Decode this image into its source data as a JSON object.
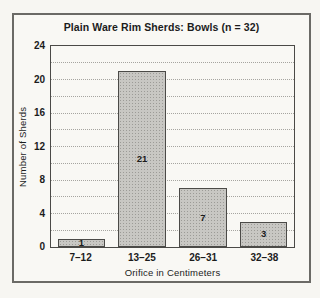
{
  "chart_data": {
    "type": "bar",
    "title": "Plain Ware Rim Sherds: Bowls (n = 32)",
    "categories": [
      "7–12",
      "13–25",
      "26–31",
      "32–38"
    ],
    "values": [
      1,
      21,
      7,
      3
    ],
    "bar_value_labels": [
      "1",
      "21",
      "7",
      "3"
    ],
    "xlabel": "Orifice in Centimeters",
    "ylabel": "Number of Sherds",
    "ylim": [
      0,
      24
    ],
    "yticks": [
      0,
      4,
      8,
      12,
      16,
      20,
      24
    ],
    "gridline_step": 2,
    "grid": "horizontal-dotted",
    "legend": "none",
    "colors": {
      "bar_fill": "#c8c7c3",
      "bar_stipple": "#9c9b97",
      "bar_border": "#4b4a47",
      "plot_border": "#4b4a47",
      "gridline": "#a6a5a0",
      "outer_border": "#6b6a66",
      "background": "#f9f8f4",
      "text": "#1c1c1c"
    }
  }
}
